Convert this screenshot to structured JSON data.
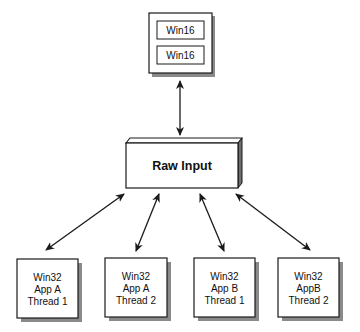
{
  "diagram": {
    "top_group": {
      "items": [
        "Win16",
        "Win16"
      ]
    },
    "center": {
      "label": "Raw Input"
    },
    "bottom_boxes": [
      {
        "lines": [
          "Win32",
          "App A",
          "Thread 1"
        ]
      },
      {
        "lines": [
          "Win32",
          "App A",
          "Thread 2"
        ]
      },
      {
        "lines": [
          "Win32",
          "App B",
          "Thread 1"
        ]
      },
      {
        "lines": [
          "Win32",
          "AppB",
          "Thread 2"
        ]
      }
    ],
    "connections": [
      {
        "from": "top_group",
        "to": "center",
        "direction": "bidirectional"
      },
      {
        "from": "center",
        "to": "bottom_boxes.0",
        "direction": "bidirectional"
      },
      {
        "from": "center",
        "to": "bottom_boxes.1",
        "direction": "bidirectional"
      },
      {
        "from": "center",
        "to": "bottom_boxes.2",
        "direction": "bidirectional"
      },
      {
        "from": "center",
        "to": "bottom_boxes.3",
        "direction": "bidirectional"
      }
    ],
    "colors": {
      "stroke": "#1a1a1a",
      "shadow": "#8a8a8a",
      "box_fill": "#ffffff"
    }
  }
}
